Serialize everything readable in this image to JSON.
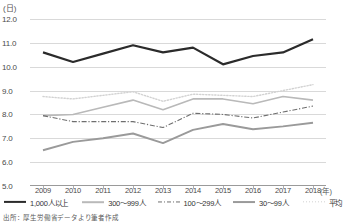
{
  "chart_data": {
    "type": "line",
    "title": "",
    "xlabel": "(年)",
    "ylabel": "(日)",
    "ylim": [
      5.0,
      12.0
    ],
    "ytick_step": 1.0,
    "grid": true,
    "legend_position": "bottom",
    "categories": [
      "2009",
      "2010",
      "2011",
      "2012",
      "2013",
      "2014",
      "2015",
      "2016",
      "2017",
      "2018"
    ],
    "yticks": [
      "12.0",
      "11.0",
      "10.0",
      "9.0",
      "8.0",
      "7.0",
      "6.0",
      "5.0"
    ],
    "series": [
      {
        "name": "1,000人以上",
        "color": "#2b2b2b",
        "style": "solid",
        "width": 2.2,
        "values": [
          10.6,
          10.2,
          10.55,
          10.9,
          10.6,
          10.8,
          10.1,
          10.45,
          10.6,
          11.15
        ]
      },
      {
        "name": "300～999人",
        "color": "#b9b9b9",
        "style": "solid",
        "width": 1.6,
        "values": [
          7.95,
          8.0,
          8.3,
          8.6,
          8.2,
          8.65,
          8.65,
          8.45,
          8.75,
          8.6
        ]
      },
      {
        "name": "100～299人",
        "color": "#6f6f6f",
        "style": "dashdot",
        "width": 1.1,
        "values": [
          7.95,
          7.7,
          7.7,
          7.7,
          7.45,
          8.05,
          8.0,
          7.85,
          8.1,
          8.35
        ]
      },
      {
        "name": "30～99人",
        "color": "#9a9a9a",
        "style": "solid",
        "width": 1.9,
        "values": [
          6.5,
          6.85,
          7.0,
          7.2,
          6.8,
          7.35,
          7.6,
          7.38,
          7.5,
          7.65
        ]
      },
      {
        "name": "平均",
        "color": "#d2d2d2",
        "style": "dotted",
        "width": 1.4,
        "values": [
          8.75,
          8.65,
          8.8,
          8.95,
          8.55,
          8.85,
          8.8,
          8.75,
          9.0,
          9.25
        ]
      }
    ]
  },
  "footer": {
    "source": "出所：厚生労働省データより筆者作成"
  }
}
